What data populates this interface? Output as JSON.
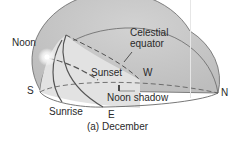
{
  "figure": {
    "caption": "(a) December",
    "labels": {
      "noon": "Noon",
      "celestial_equator_line1": "Celestial",
      "celestial_equator_line2": "equator",
      "sunset": "Sunset",
      "west": "W",
      "south": "S",
      "north": "N",
      "east": "E",
      "sunrise": "Sunrise",
      "noon_shadow": "Noon shadow"
    },
    "colors": {
      "dome_fill": "#c9c9c9",
      "dome_front": "#dcdcdc",
      "outline": "#555555",
      "sun_path": "#6a6a6a",
      "background": "#ffffff"
    }
  }
}
